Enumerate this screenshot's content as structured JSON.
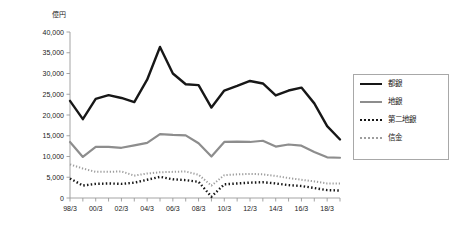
{
  "chart_data": {
    "type": "line",
    "title": "",
    "subtitle": "",
    "xlabel": "",
    "ylabel": "億円",
    "y_unit_label": "億円",
    "ylim": [
      0,
      40000
    ],
    "ytick_values": [
      0,
      5000,
      10000,
      15000,
      20000,
      25000,
      30000,
      35000,
      40000
    ],
    "ytick_labels": [
      "0",
      "5,000",
      "10,000",
      "15,000",
      "20,000",
      "25,000",
      "30,000",
      "35,000",
      "40,000"
    ],
    "grid": false,
    "legend_position": "right",
    "x": [
      "98/3",
      "99/3",
      "00/3",
      "01/3",
      "02/3",
      "03/3",
      "04/3",
      "05/3",
      "06/3",
      "07/3",
      "08/3",
      "09/3",
      "10/3",
      "11/3",
      "12/3",
      "13/3",
      "14/3",
      "15/3",
      "16/3",
      "17/3",
      "18/3",
      "19/3"
    ],
    "categories": [
      "98/3",
      "99/3",
      "00/3",
      "01/3",
      "02/3",
      "03/3",
      "04/3",
      "05/3",
      "06/3",
      "07/3",
      "08/3",
      "09/3",
      "10/3",
      "11/3",
      "12/3",
      "13/3",
      "14/3",
      "15/3",
      "16/3",
      "17/3",
      "18/3",
      "19/3"
    ],
    "xtick_labels_shown": [
      "98/3",
      "00/3",
      "02/3",
      "04/3",
      "06/3",
      "08/3",
      "10/3",
      "12/3",
      "14/3",
      "16/3",
      "18/3"
    ],
    "series": [
      {
        "name": "都銀",
        "color": "#171717",
        "style": "solid",
        "width": 2.4,
        "values": [
          23400,
          19000,
          23900,
          24800,
          24100,
          23100,
          28500,
          36400,
          30000,
          27400,
          27200,
          21800,
          25900,
          27000,
          28200,
          27600,
          24700,
          25900,
          26600,
          22800,
          17300,
          14100
        ]
      },
      {
        "name": "地銀",
        "color": "#8d8d8d",
        "style": "solid",
        "width": 2.2,
        "values": [
          13500,
          9900,
          12300,
          12300,
          12100,
          12700,
          13300,
          15400,
          15200,
          15100,
          13200,
          10000,
          13500,
          13600,
          13500,
          13800,
          12400,
          12900,
          12600,
          11100,
          9800,
          9700
        ]
      },
      {
        "name": "第二地銀",
        "color": "#171717",
        "style": "dotted",
        "width": 2.4,
        "values": [
          4700,
          3000,
          3400,
          3500,
          3400,
          3700,
          4400,
          5100,
          4500,
          4300,
          3900,
          300,
          3300,
          3500,
          3700,
          3800,
          3500,
          3100,
          2900,
          2400,
          1900,
          1800
        ]
      },
      {
        "name": "信金",
        "color": "#9e9e9e",
        "style": "dotted",
        "width": 2.0,
        "values": [
          8100,
          7100,
          6300,
          6300,
          6400,
          5400,
          5900,
          6200,
          6300,
          6400,
          5600,
          3000,
          5500,
          5700,
          5800,
          5700,
          5300,
          4800,
          4400,
          4000,
          3500,
          3500
        ]
      }
    ]
  },
  "legend": {
    "items": [
      {
        "label": "都銀",
        "icon": "line-solid-black-icon"
      },
      {
        "label": "地銀",
        "icon": "line-solid-gray-icon"
      },
      {
        "label": "第二地銀",
        "icon": "line-dotted-black-icon"
      },
      {
        "label": "信金",
        "icon": "line-dotted-gray-icon"
      }
    ]
  },
  "axis": {
    "y_unit": "億円"
  }
}
